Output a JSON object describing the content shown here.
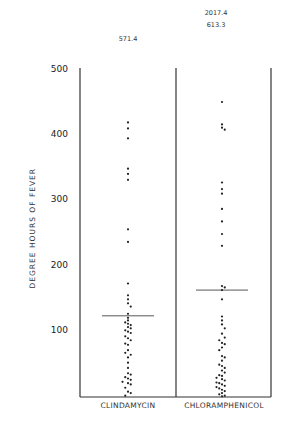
{
  "chart_data": {
    "type": "scatter",
    "subtype": "dot-strip",
    "title": "",
    "xlabel": "",
    "ylabel": "DEGREE HOURS OF FEVER",
    "ylim": [
      0,
      500
    ],
    "yticks": [
      100,
      200,
      300,
      400,
      500
    ],
    "categories": [
      "CLINDAMYCIN",
      "CHLORAMPHENICOL"
    ],
    "off_scale_values": {
      "CLINDAMYCIN": [
        571.4
      ],
      "CHLORAMPHENICOL": [
        2017.4,
        613.3
      ]
    },
    "means_approx": {
      "CLINDAMYCIN": 123,
      "CHLORAMPHENICOL": 162
    },
    "series": [
      {
        "name": "CLINDAMYCIN",
        "points": [
          [
            0,
            416
          ],
          [
            0,
            407
          ],
          [
            0,
            392
          ],
          [
            0,
            346
          ],
          [
            0,
            338
          ],
          [
            0,
            329
          ],
          [
            0,
            254
          ],
          [
            0,
            235
          ],
          [
            0,
            172
          ],
          [
            0,
            154
          ],
          [
            0,
            148
          ],
          [
            0,
            142
          ],
          [
            5,
            137
          ],
          [
            0,
            126
          ],
          [
            0,
            120
          ],
          [
            0,
            116
          ],
          [
            -5,
            113
          ],
          [
            0,
            111
          ],
          [
            5,
            109
          ],
          [
            0,
            106
          ],
          [
            5,
            104
          ],
          [
            -5,
            101
          ],
          [
            0,
            99
          ],
          [
            5,
            97
          ],
          [
            -5,
            92
          ],
          [
            0,
            89
          ],
          [
            5,
            86
          ],
          [
            -5,
            81
          ],
          [
            0,
            79
          ],
          [
            0,
            71
          ],
          [
            -5,
            67
          ],
          [
            5,
            64
          ],
          [
            0,
            60
          ],
          [
            0,
            52
          ],
          [
            0,
            44
          ],
          [
            0,
            36
          ],
          [
            5,
            34
          ],
          [
            -5,
            30
          ],
          [
            0,
            28
          ],
          [
            5,
            26
          ],
          [
            -10,
            23
          ],
          [
            0,
            21
          ],
          [
            5,
            19
          ],
          [
            -5,
            14
          ],
          [
            0,
            8
          ],
          [
            5,
            6
          ],
          [
            -5,
            2
          ]
        ]
      },
      {
        "name": "CHLORAMPHENICOL",
        "points": [
          [
            0,
            447
          ],
          [
            0,
            413
          ],
          [
            0,
            408
          ],
          [
            5,
            405
          ],
          [
            0,
            325
          ],
          [
            0,
            315
          ],
          [
            0,
            308
          ],
          [
            0,
            285
          ],
          [
            0,
            266
          ],
          [
            0,
            247
          ],
          [
            0,
            229
          ],
          [
            0,
            168
          ],
          [
            5,
            166
          ],
          [
            0,
            162
          ],
          [
            0,
            148
          ],
          [
            0,
            122
          ],
          [
            0,
            116
          ],
          [
            0,
            110
          ],
          [
            5,
            104
          ],
          [
            0,
            96
          ],
          [
            5,
            90
          ],
          [
            -5,
            86
          ],
          [
            0,
            82
          ],
          [
            5,
            80
          ],
          [
            0,
            75
          ],
          [
            -5,
            71
          ],
          [
            0,
            62
          ],
          [
            5,
            60
          ],
          [
            0,
            55
          ],
          [
            -5,
            49
          ],
          [
            0,
            47
          ],
          [
            5,
            44
          ],
          [
            0,
            40
          ],
          [
            5,
            37
          ],
          [
            -5,
            33
          ],
          [
            0,
            32
          ],
          [
            -10,
            29
          ],
          [
            0,
            27
          ],
          [
            5,
            25
          ],
          [
            -10,
            22
          ],
          [
            -5,
            21
          ],
          [
            0,
            19
          ],
          [
            5,
            17
          ],
          [
            -10,
            15
          ],
          [
            -5,
            13
          ],
          [
            0,
            11
          ],
          [
            5,
            9
          ],
          [
            0,
            6
          ],
          [
            -5,
            4
          ],
          [
            5,
            2
          ],
          [
            0,
            1
          ]
        ]
      }
    ],
    "legend": null,
    "grid": false
  },
  "axis": {
    "ylabel": "DEGREE HOURS OF FEVER",
    "ticks": [
      "500",
      "400",
      "300",
      "200",
      "100"
    ]
  },
  "labels": {
    "cat_left": "CLINDAMYCIN",
    "cat_right": "CHLORAMPHENICOL",
    "off_left": "571.4",
    "off_right_1": "2017.4",
    "off_right_2": "613.3"
  }
}
